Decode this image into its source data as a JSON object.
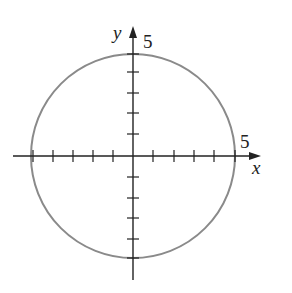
{
  "diagram": {
    "type": "circle-on-axes",
    "equation_hint": "circle centered at origin, radius 5",
    "center": [
      0,
      0
    ],
    "radius": 5,
    "axes": {
      "x_label": "x",
      "y_label": "y",
      "x_tick_label": "5",
      "y_tick_label": "5",
      "ticks_per_side": 5
    },
    "colors": {
      "circle": "#8a8a8a",
      "axes": "#222222"
    }
  }
}
